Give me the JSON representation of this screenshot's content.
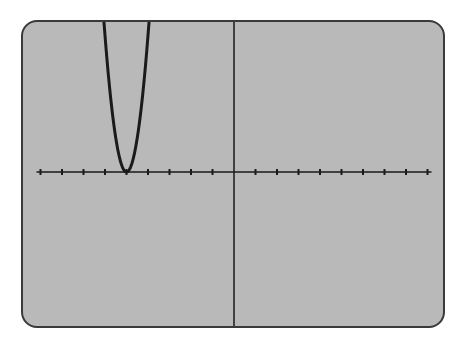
{
  "screen": {
    "background_color": "#b9b9b9",
    "border_color": "#3a3a3a",
    "curve_color": "#1a1a1a",
    "axis_color": "#1a1a1a"
  },
  "chart_data": {
    "type": "line",
    "title": "",
    "xlabel": "",
    "ylabel": "",
    "function": "y = (x + 5)^2",
    "xlim": [
      -9,
      9
    ],
    "ylim": [
      -7,
      7
    ],
    "x_tick_step": 1,
    "x_ticks": [
      -9,
      -8,
      -7,
      -6,
      -5,
      -4,
      -3,
      -2,
      -1,
      1,
      2,
      3,
      4,
      5,
      6,
      7,
      8,
      9
    ],
    "grid": false,
    "legend": null,
    "series": [
      {
        "name": "parabola",
        "x": [
          -6.05,
          -5.75,
          -5.5,
          -5.25,
          -5,
          -4.75,
          -4.5,
          -4.25,
          -3.95
        ],
        "y": [
          7,
          3.1,
          1.4,
          0.35,
          0,
          0.35,
          1.4,
          3.1,
          7
        ]
      }
    ],
    "vertex": [
      -5,
      0
    ]
  }
}
